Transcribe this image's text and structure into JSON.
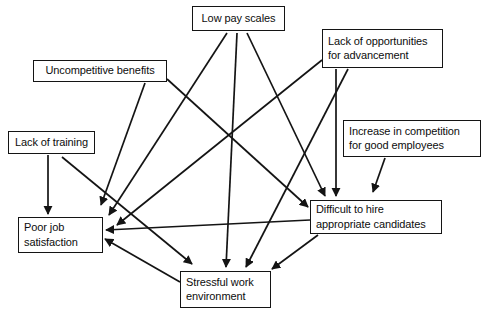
{
  "diagram": {
    "background_color": "#ffffff",
    "line_color": "#141414",
    "text_color": "#0d0d0d",
    "nodes": [
      {
        "id": "low-pay-scales",
        "label": "Low pay scales",
        "x": 192,
        "y": 6,
        "w": 93,
        "h": 25,
        "align": "center"
      },
      {
        "id": "lack-of-opportunities",
        "label": "Lack of opportunities\nfor advancement",
        "x": 322,
        "y": 29,
        "w": 121,
        "h": 39,
        "align": "left"
      },
      {
        "id": "uncompetitive-benefits",
        "label": "Uncompetitive benefits",
        "x": 33,
        "y": 60,
        "w": 134,
        "h": 22,
        "align": "center"
      },
      {
        "id": "increase-in-competition",
        "label": "Increase in competition\nfor good employees",
        "x": 343,
        "y": 120,
        "w": 138,
        "h": 37,
        "align": "left"
      },
      {
        "id": "lack-of-training",
        "label": "Lack of training",
        "x": 8,
        "y": 131,
        "w": 87,
        "h": 23,
        "align": "center"
      },
      {
        "id": "difficult-to-hire",
        "label": "Difficult to hire\nappropriate candidates",
        "x": 310,
        "y": 200,
        "w": 132,
        "h": 34,
        "align": "left"
      },
      {
        "id": "poor-job-satisfaction",
        "label": "Poor job\nsatisfaction",
        "x": 18,
        "y": 217,
        "w": 85,
        "h": 36,
        "align": "left"
      },
      {
        "id": "stressful-work-environment",
        "label": "Stressful work\nenvironment",
        "x": 180,
        "y": 271,
        "w": 91,
        "h": 37,
        "align": "left"
      }
    ],
    "edges": [
      {
        "id": "edge-low-pay-to-poor-job",
        "from": "low-pay-scales",
        "to": "poor-job-satisfaction",
        "x1": 227,
        "y1": 33,
        "x2": 109,
        "y2": 215
      },
      {
        "id": "edge-low-pay-to-stressful",
        "from": "low-pay-scales",
        "to": "stressful-work-environment",
        "x1": 237,
        "y1": 33,
        "x2": 226,
        "y2": 267
      },
      {
        "id": "edge-low-pay-to-difficult-hire",
        "from": "low-pay-scales",
        "to": "difficult-to-hire",
        "x1": 247,
        "y1": 33,
        "x2": 325,
        "y2": 196
      },
      {
        "id": "edge-opportunities-to-poor-job",
        "from": "lack-of-opportunities",
        "to": "poor-job-satisfaction",
        "x1": 322,
        "y1": 60,
        "x2": 117,
        "y2": 225
      },
      {
        "id": "edge-opportunities-to-difficult-hire",
        "from": "lack-of-opportunities",
        "to": "difficult-to-hire",
        "x1": 336,
        "y1": 69,
        "x2": 336,
        "y2": 196
      },
      {
        "id": "edge-opportunities-to-stressful",
        "from": "lack-of-opportunities",
        "to": "stressful-work-environment",
        "x1": 348,
        "y1": 69,
        "x2": 246,
        "y2": 267
      },
      {
        "id": "edge-uncompetitive-to-poor-job",
        "from": "uncompetitive-benefits",
        "to": "poor-job-satisfaction",
        "x1": 145,
        "y1": 83,
        "x2": 101,
        "y2": 205
      },
      {
        "id": "edge-uncompetitive-to-difficult-hire",
        "from": "uncompetitive-benefits",
        "to": "difficult-to-hire",
        "x1": 167,
        "y1": 79,
        "x2": 308,
        "y2": 207
      },
      {
        "id": "edge-competition-to-difficult-hire",
        "from": "increase-in-competition",
        "to": "difficult-to-hire",
        "x1": 385,
        "y1": 158,
        "x2": 373,
        "y2": 192
      },
      {
        "id": "edge-training-to-poor-job",
        "from": "lack-of-training",
        "to": "poor-job-satisfaction",
        "x1": 48,
        "y1": 155,
        "x2": 48,
        "y2": 214
      },
      {
        "id": "edge-training-to-stressful",
        "from": "lack-of-training",
        "to": "stressful-work-environment",
        "x1": 62,
        "y1": 157,
        "x2": 192,
        "y2": 264
      },
      {
        "id": "edge-difficult-hire-to-poor-job",
        "from": "difficult-to-hire",
        "to": "poor-job-satisfaction",
        "x1": 310,
        "y1": 220,
        "x2": 106,
        "y2": 230
      },
      {
        "id": "edge-difficult-hire-to-stressful",
        "from": "difficult-to-hire",
        "to": "stressful-work-environment",
        "x1": 318,
        "y1": 235,
        "x2": 272,
        "y2": 269
      },
      {
        "id": "edge-stressful-to-poor-job",
        "from": "stressful-work-environment",
        "to": "poor-job-satisfaction",
        "x1": 180,
        "y1": 282,
        "x2": 105,
        "y2": 239
      }
    ]
  }
}
